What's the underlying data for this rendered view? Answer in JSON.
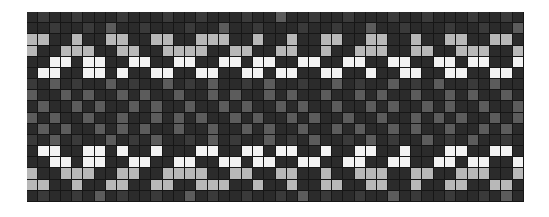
{
  "figure": {
    "kind": "heatmap-image",
    "background_color": "#ffffff",
    "plot_background_color": "#1a1a1a",
    "gridline_color": "#161616"
  },
  "chart_data": {
    "type": "heatmap",
    "title": "",
    "subtitle": "",
    "xlabel": "",
    "ylabel": "",
    "xticklabels": [],
    "yticklabels": [],
    "legend": [],
    "grid": true,
    "legend_position": "none",
    "rows": 17,
    "cols": 44,
    "cell_width_px": 11.3,
    "cell_height_px": 11.2,
    "colorscale": {
      "name": "grayscale",
      "levels": [
        0,
        1,
        2,
        3,
        4
      ],
      "colors": [
        "#2b2b2b",
        "#3a3a3a",
        "#5c5c5c",
        "#b8b8b8",
        "#f2f2f2"
      ],
      "level_labels": [
        "lowest",
        "low",
        "medium",
        "high",
        "highest"
      ],
      "vmin": 0,
      "vmax": 4
    },
    "annotations": [
      "Two bright repeating zigzag bands near the top and bottom of the grid",
      "Darker low-intensity region through the vertical middle of the grid"
    ],
    "values": [
      [
        0,
        1,
        0,
        0,
        1,
        0,
        0,
        0,
        1,
        0,
        0,
        0,
        1,
        0,
        0,
        1,
        0,
        0,
        0,
        1,
        0,
        0,
        2,
        0,
        0,
        1,
        0,
        0,
        1,
        0,
        0,
        0,
        1,
        0,
        0,
        1,
        0,
        0,
        0,
        1,
        0,
        0,
        1,
        0
      ],
      [
        0,
        0,
        1,
        0,
        0,
        1,
        0,
        2,
        0,
        0,
        1,
        0,
        0,
        0,
        1,
        0,
        0,
        2,
        0,
        0,
        1,
        0,
        0,
        0,
        1,
        0,
        0,
        1,
        0,
        0,
        2,
        0,
        0,
        1,
        0,
        0,
        0,
        1,
        0,
        0,
        1,
        0,
        0,
        2
      ],
      [
        3,
        3,
        0,
        0,
        3,
        0,
        0,
        3,
        3,
        0,
        0,
        3,
        3,
        0,
        0,
        3,
        3,
        3,
        0,
        0,
        3,
        0,
        0,
        3,
        0,
        0,
        3,
        3,
        0,
        0,
        3,
        3,
        0,
        0,
        3,
        0,
        0,
        3,
        3,
        0,
        0,
        3,
        3,
        0
      ],
      [
        3,
        0,
        0,
        3,
        3,
        3,
        0,
        0,
        3,
        3,
        0,
        0,
        3,
        3,
        3,
        3,
        0,
        0,
        3,
        3,
        0,
        0,
        3,
        3,
        0,
        0,
        3,
        0,
        0,
        3,
        3,
        3,
        0,
        0,
        3,
        3,
        0,
        0,
        3,
        3,
        3,
        0,
        0,
        3
      ],
      [
        0,
        0,
        4,
        4,
        0,
        4,
        4,
        0,
        0,
        4,
        4,
        0,
        0,
        4,
        4,
        0,
        0,
        4,
        4,
        0,
        4,
        4,
        0,
        0,
        4,
        4,
        0,
        0,
        4,
        4,
        0,
        0,
        4,
        4,
        0,
        0,
        4,
        4,
        0,
        4,
        4,
        0,
        0,
        4
      ],
      [
        0,
        4,
        4,
        0,
        0,
        4,
        4,
        0,
        4,
        0,
        0,
        4,
        4,
        0,
        0,
        4,
        4,
        0,
        0,
        4,
        4,
        0,
        4,
        4,
        0,
        0,
        4,
        4,
        0,
        0,
        4,
        0,
        0,
        4,
        4,
        0,
        0,
        4,
        4,
        0,
        0,
        4,
        4,
        0
      ],
      [
        1,
        0,
        2,
        0,
        1,
        0,
        0,
        2,
        0,
        1,
        0,
        0,
        2,
        0,
        1,
        0,
        2,
        0,
        0,
        1,
        0,
        2,
        0,
        0,
        1,
        0,
        0,
        2,
        0,
        1,
        0,
        0,
        2,
        0,
        1,
        0,
        2,
        0,
        0,
        1,
        0,
        2,
        0,
        0
      ],
      [
        2,
        0,
        0,
        2,
        0,
        2,
        0,
        0,
        2,
        0,
        2,
        0,
        0,
        2,
        0,
        0,
        2,
        0,
        2,
        0,
        0,
        2,
        0,
        2,
        0,
        0,
        2,
        0,
        0,
        2,
        0,
        2,
        0,
        0,
        2,
        0,
        0,
        2,
        0,
        2,
        0,
        0,
        2,
        0
      ],
      [
        0,
        2,
        0,
        0,
        2,
        0,
        2,
        0,
        0,
        2,
        0,
        2,
        0,
        0,
        2,
        0,
        0,
        2,
        0,
        2,
        0,
        0,
        2,
        0,
        2,
        0,
        0,
        2,
        0,
        0,
        2,
        0,
        2,
        0,
        0,
        2,
        0,
        2,
        0,
        0,
        2,
        0,
        0,
        2
      ],
      [
        2,
        0,
        2,
        0,
        0,
        2,
        0,
        0,
        2,
        0,
        0,
        2,
        0,
        2,
        0,
        2,
        0,
        0,
        2,
        0,
        2,
        0,
        0,
        2,
        0,
        2,
        0,
        0,
        2,
        0,
        0,
        2,
        0,
        0,
        2,
        0,
        2,
        0,
        2,
        0,
        0,
        2,
        0,
        2
      ],
      [
        0,
        2,
        0,
        2,
        0,
        0,
        2,
        0,
        2,
        0,
        2,
        0,
        0,
        2,
        0,
        0,
        2,
        0,
        0,
        2,
        0,
        2,
        0,
        0,
        2,
        0,
        0,
        2,
        0,
        2,
        0,
        0,
        2,
        0,
        2,
        0,
        0,
        2,
        0,
        0,
        2,
        0,
        2,
        0
      ],
      [
        1,
        0,
        2,
        0,
        1,
        0,
        0,
        2,
        0,
        1,
        0,
        2,
        0,
        0,
        1,
        0,
        2,
        0,
        1,
        0,
        0,
        2,
        0,
        1,
        0,
        2,
        0,
        0,
        1,
        0,
        2,
        0,
        1,
        0,
        0,
        2,
        0,
        1,
        0,
        2,
        0,
        0,
        1,
        0
      ],
      [
        0,
        4,
        4,
        0,
        0,
        4,
        4,
        0,
        4,
        0,
        0,
        4,
        0,
        0,
        0,
        4,
        4,
        0,
        0,
        4,
        4,
        0,
        4,
        4,
        0,
        0,
        4,
        0,
        0,
        4,
        4,
        0,
        0,
        4,
        0,
        0,
        0,
        4,
        4,
        0,
        0,
        4,
        4,
        0
      ],
      [
        0,
        0,
        4,
        4,
        0,
        4,
        4,
        0,
        0,
        4,
        4,
        0,
        0,
        4,
        4,
        0,
        0,
        4,
        4,
        0,
        4,
        4,
        0,
        0,
        4,
        4,
        0,
        0,
        4,
        4,
        0,
        0,
        4,
        4,
        0,
        0,
        4,
        4,
        0,
        4,
        4,
        0,
        0,
        4
      ],
      [
        3,
        0,
        0,
        3,
        3,
        3,
        0,
        0,
        3,
        3,
        0,
        0,
        3,
        3,
        3,
        3,
        0,
        0,
        3,
        3,
        0,
        0,
        3,
        3,
        0,
        0,
        3,
        0,
        0,
        3,
        3,
        3,
        0,
        0,
        3,
        3,
        0,
        0,
        3,
        3,
        3,
        0,
        0,
        3
      ],
      [
        3,
        3,
        0,
        0,
        3,
        0,
        0,
        3,
        3,
        0,
        0,
        3,
        3,
        0,
        0,
        3,
        3,
        3,
        0,
        0,
        3,
        0,
        0,
        3,
        0,
        0,
        3,
        3,
        0,
        0,
        3,
        3,
        0,
        0,
        3,
        0,
        0,
        3,
        3,
        0,
        0,
        3,
        3,
        0
      ],
      [
        0,
        1,
        0,
        0,
        1,
        0,
        2,
        0,
        1,
        0,
        0,
        1,
        0,
        0,
        2,
        0,
        1,
        0,
        0,
        1,
        0,
        0,
        1,
        0,
        2,
        0,
        1,
        0,
        0,
        1,
        0,
        0,
        2,
        0,
        1,
        0,
        0,
        1,
        0,
        0,
        1,
        0,
        2,
        0
      ]
    ]
  }
}
